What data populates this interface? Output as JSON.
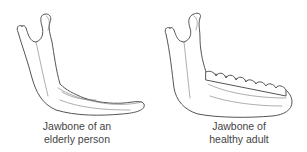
{
  "figures": [
    {
      "id": "elderly",
      "caption_line1": "Jawbone of an",
      "caption_line2": "elderly person",
      "has_teeth": false
    },
    {
      "id": "healthy",
      "caption_line1": "Jawbone of",
      "caption_line2": "healthy adult",
      "has_teeth": true
    }
  ],
  "colors": {
    "line": "#555555",
    "text": "#444444",
    "background": "#ffffff"
  }
}
